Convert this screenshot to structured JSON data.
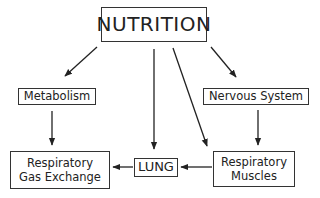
{
  "diagram": {
    "type": "flow",
    "nodes": {
      "nutrition": {
        "label": "NUTRITION"
      },
      "metabolism": {
        "label": "Metabolism"
      },
      "nervous_system": {
        "label": "Nervous System"
      },
      "gas_exchange": {
        "line1": "Respiratory",
        "line2": "Gas Exchange"
      },
      "lung": {
        "label": "LUNG"
      },
      "muscles": {
        "line1": "Respiratory",
        "line2": "Muscles"
      }
    },
    "edges": [
      {
        "from": "NUTRITION",
        "to": "Metabolism"
      },
      {
        "from": "NUTRITION",
        "to": "LUNG"
      },
      {
        "from": "NUTRITION",
        "to": "Respiratory Muscles"
      },
      {
        "from": "NUTRITION",
        "to": "Nervous System"
      },
      {
        "from": "Metabolism",
        "to": "Respiratory Gas Exchange"
      },
      {
        "from": "Nervous System",
        "to": "Respiratory Muscles"
      },
      {
        "from": "LUNG",
        "to": "Respiratory Gas Exchange"
      },
      {
        "from": "Respiratory Muscles",
        "to": "LUNG"
      }
    ]
  }
}
